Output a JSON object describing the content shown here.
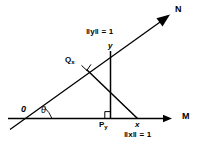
{
  "figure": {
    "kind": "vector-projection-geometry-diagram",
    "background_color": "#ffffff",
    "stroke_color": "#000000",
    "width": 208,
    "height": 146,
    "axes": {
      "horizontal": {
        "name": "M",
        "label": "M",
        "arrow": "right"
      },
      "diagonal": {
        "name": "N",
        "label": "N",
        "arrow": "up-right"
      }
    },
    "labels": {
      "origin": "0",
      "angle": "θ",
      "point_y": "y",
      "point_x": "x",
      "projection_of_x": "Q",
      "projection_of_x_sub": "x",
      "projection_of_y": "P",
      "projection_of_y_sub": "y",
      "norm_y": "‖y‖ = 1",
      "norm_x": "‖x‖ = 1"
    },
    "annotations": {
      "right_angle_at_Qx": "right-angle-mark",
      "right_angle_at_Py": "right-angle-mark"
    }
  }
}
